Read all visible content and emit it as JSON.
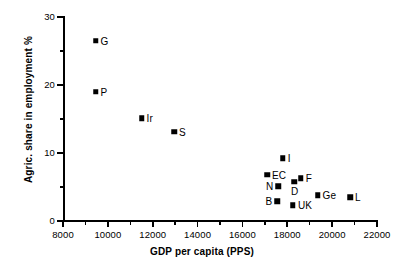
{
  "chart_data": {
    "type": "scatter",
    "title": "",
    "xlabel": "GDP per capita (PPS)",
    "ylabel": "Agric. share in employment %",
    "xlim": [
      8000,
      22000
    ],
    "ylim": [
      0,
      30
    ],
    "grid": false,
    "legend": "none",
    "xticks": [
      8000,
      10000,
      12000,
      14000,
      16000,
      18000,
      20000,
      22000
    ],
    "xtick_labels": [
      "8000",
      "10000",
      "12000",
      "14000",
      "16000",
      "18000",
      "20000",
      "22000"
    ],
    "xticks_minor": [
      9000,
      11000,
      13000,
      15000,
      17000,
      19000,
      21000
    ],
    "yticks": [
      0,
      10,
      20,
      30
    ],
    "ytick_labels": [
      "0",
      "10",
      "20",
      "30"
    ],
    "yticks_minor": [
      5,
      15,
      25
    ],
    "marker": "filled-square",
    "points": [
      {
        "label": "G",
        "x": 9450,
        "y": 26.5,
        "label_side": "right"
      },
      {
        "label": "P",
        "x": 9450,
        "y": 19.0,
        "label_side": "right"
      },
      {
        "label": "Ir",
        "x": 11500,
        "y": 15.1,
        "label_side": "right"
      },
      {
        "label": "S",
        "x": 12950,
        "y": 13.1,
        "label_side": "right"
      },
      {
        "label": "I",
        "x": 17800,
        "y": 9.2,
        "label_side": "right"
      },
      {
        "label": "EC",
        "x": 17100,
        "y": 6.8,
        "label_side": "right"
      },
      {
        "label": "F",
        "x": 18600,
        "y": 6.3,
        "label_side": "right"
      },
      {
        "label": "D",
        "x": 18300,
        "y": 5.8,
        "label_side": "below"
      },
      {
        "label": "N",
        "x": 17600,
        "y": 5.1,
        "label_side": "left"
      },
      {
        "label": "Ge",
        "x": 19350,
        "y": 3.8,
        "label_side": "right"
      },
      {
        "label": "L",
        "x": 20800,
        "y": 3.5,
        "label_side": "right"
      },
      {
        "label": "B",
        "x": 17550,
        "y": 2.9,
        "label_side": "left"
      },
      {
        "label": "UK",
        "x": 18250,
        "y": 2.3,
        "label_side": "right"
      }
    ]
  }
}
